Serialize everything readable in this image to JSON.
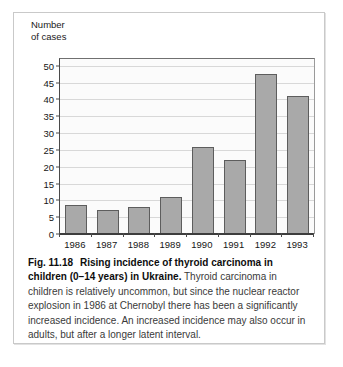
{
  "figure": {
    "number_label": "Fig. 11.18",
    "title_bold": "Rising incidence of thyroid carcinoma in children (0–14 years) in Ukraine.",
    "body_text": " Thyroid carcinoma in children is relatively uncommon, but since the nuclear reactor explosion in 1986 at Chernobyl there has been a significantly increased incidence. An increased incidence may also occur in adults, but after a longer latent interval."
  },
  "axis": {
    "y_title": "Number\nof cases",
    "y_ticks": [
      "0",
      "5",
      "10",
      "15",
      "20",
      "25",
      "30",
      "35",
      "40",
      "45",
      "50"
    ]
  },
  "chart_data": {
    "type": "bar",
    "title": "Rising incidence of thyroid carcinoma in children (0–14 years) in Ukraine",
    "xlabel": "",
    "ylabel": "Number of cases",
    "categories": [
      "1986",
      "1987",
      "1988",
      "1989",
      "1990",
      "1991",
      "1992",
      "1993"
    ],
    "values": [
      8.5,
      7,
      8,
      11,
      26,
      22,
      47.5,
      41
    ],
    "ylim": [
      0,
      52
    ],
    "ytick_interval": 5,
    "grid": true,
    "legend": false,
    "bar_color": "#a9a9a9",
    "bar_border_color": "#5d5d5d",
    "plot_background": "#fbfbfb",
    "gridline_color": "#d8d8d8"
  }
}
